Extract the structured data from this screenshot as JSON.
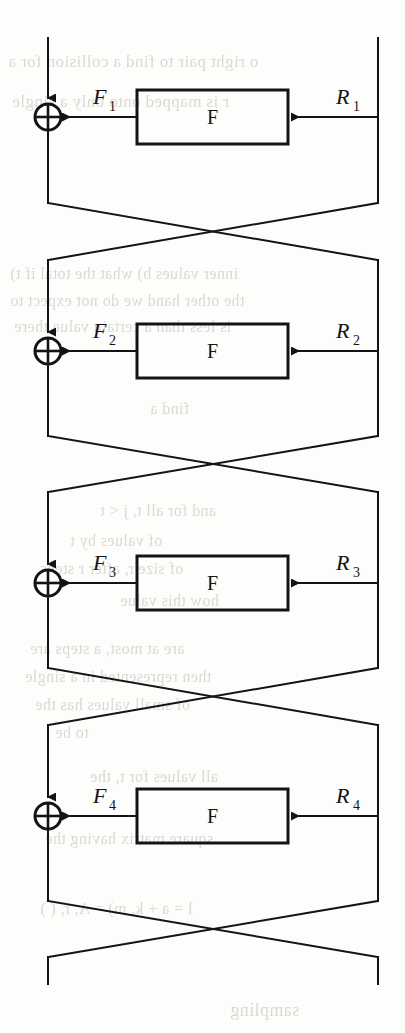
{
  "document": {
    "kind": "scanned-book-figure",
    "figure_type": "feistel-network",
    "page_background": "#fdfdfc",
    "ink_color": "#141414",
    "ghost_text_color": "#b9b5ae"
  },
  "diagram": {
    "name": "Feistel network, four rounds",
    "round_count": 4,
    "function_box_label": "F",
    "xor_symbol": "⊕",
    "rounds": [
      {
        "index": 1,
        "f_label": "F",
        "f_label_sub": "1",
        "r_label": "R",
        "r_label_sub": "1",
        "xor_center_y": 117,
        "box_top": 90,
        "box_bottom": 144
      },
      {
        "index": 2,
        "f_label": "F",
        "f_label_sub": "2",
        "r_label": "R",
        "r_label_sub": "2",
        "xor_center_y": 351,
        "box_top": 324,
        "box_bottom": 378
      },
      {
        "index": 3,
        "f_label": "F",
        "f_label_sub": "3",
        "r_label": "R",
        "r_label_sub": "3",
        "xor_center_y": 583,
        "box_top": 556,
        "box_bottom": 610
      },
      {
        "index": 4,
        "f_label": "F",
        "f_label_sub": "4",
        "r_label": "R",
        "r_label_sub": "4",
        "xor_center_y": 816,
        "box_top": 789,
        "box_bottom": 843
      }
    ],
    "geometry": {
      "left_rail_x": 48,
      "right_rail_x": 378,
      "box_left": 137,
      "box_right": 288,
      "xor_radius": 13,
      "top_wire_y": 38,
      "bottom_wire_y": 984
    }
  },
  "ghost_text": {
    "note": "faint bleed-through text from the reverse side of the scanned page",
    "lines": [
      {
        "text": "o right pair to find a collision for a",
        "x": 8,
        "y": 52,
        "size": 17
      },
      {
        "text": "r is mapped onto only a single",
        "x": 12,
        "y": 92,
        "size": 17
      },
      {
        "text": "inner values b) what the total if t)",
        "x": 10,
        "y": 265,
        "size": 16
      },
      {
        "text": "the other hand we do not expect to",
        "x": 10,
        "y": 292,
        "size": 16
      },
      {
        "text": "is less than a certain value there",
        "x": 14,
        "y": 318,
        "size": 16
      },
      {
        "text": "find a",
        "x": 150,
        "y": 400,
        "size": 16
      },
      {
        "text": "and for all t, j < t",
        "x": 100,
        "y": 502,
        "size": 16
      },
      {
        "text": "of values by t",
        "x": 70,
        "y": 532,
        "size": 16
      },
      {
        "text": "of size r, after r steps",
        "x": 40,
        "y": 560,
        "size": 16
      },
      {
        "text": "how this value",
        "x": 120,
        "y": 592,
        "size": 16
      },
      {
        "text": "are at most, a steps are",
        "x": 30,
        "y": 640,
        "size": 16
      },
      {
        "text": "then represented in a single",
        "x": 25,
        "y": 668,
        "size": 16
      },
      {
        "text": "of small values has the",
        "x": 35,
        "y": 696,
        "size": 16
      },
      {
        "text": "to be",
        "x": 55,
        "y": 724,
        "size": 16
      },
      {
        "text": "all values for t, the",
        "x": 90,
        "y": 768,
        "size": 16
      },
      {
        "text": "square matrix having the",
        "x": 45,
        "y": 830,
        "size": 16
      },
      {
        "text": "l = a + k, m) = A, r, ( )",
        "x": 40,
        "y": 900,
        "size": 16
      },
      {
        "text": "sampling",
        "x": 230,
        "y": 1000,
        "size": 18
      }
    ]
  }
}
